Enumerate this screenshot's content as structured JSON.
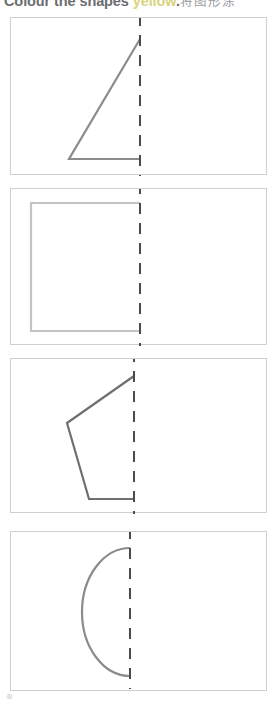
{
  "worksheet": {
    "instruction_prefix": "Colour the shapes ",
    "instruction_accent": "yellow",
    "instruction_suffix": ".",
    "instruction_cjk": "将图形涂",
    "instruction_full": "Colour the shapes yellow. 将图形涂",
    "fold_line_color": "#4a4a4a",
    "panel_border_color": "#cfcfcf",
    "accent_color": "#d9d47c"
  },
  "panels": [
    {
      "index": 1,
      "shape_name": "half-triangle",
      "label": "right triangle half",
      "stroke_color": "#8b8b8b",
      "fold_line_x": 129,
      "geometry": {
        "type": "polyline",
        "points": "129,21 58,141 129,141"
      }
    },
    {
      "index": 2,
      "shape_name": "half-rectangle",
      "label": "rectangle half",
      "stroke_color": "#c3c3c3",
      "fold_line_x": 129,
      "geometry": {
        "type": "polyline",
        "points": "129,14 20,14 20,142 129,142"
      }
    },
    {
      "index": 3,
      "shape_name": "half-pentagon",
      "label": "pentagon half",
      "stroke_color": "#6f6f6f",
      "fold_line_x": 123,
      "geometry": {
        "type": "polyline",
        "points": "123,17 56,64 78,140 123,140"
      }
    },
    {
      "index": 4,
      "shape_name": "half-circle",
      "label": "semicircle half",
      "stroke_color": "#8b8b8b",
      "fold_line_x": 119,
      "geometry": {
        "type": "arc",
        "path": "M 119,16 A 48 64 0 1 0 119,144"
      }
    }
  ]
}
